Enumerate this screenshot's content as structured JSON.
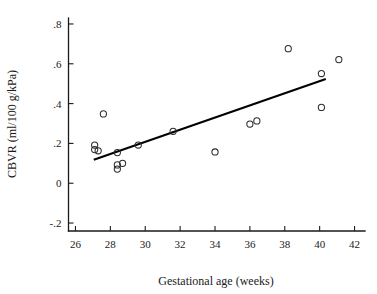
{
  "chart_data": {
    "type": "scatter",
    "title": "",
    "xlabel": "Gestational age (weeks)",
    "ylabel": "CBVR (ml/100 g/kPa)",
    "xlim": [
      25.6,
      42.6
    ],
    "ylim": [
      -0.24,
      0.83
    ],
    "xticks": [
      26,
      28,
      30,
      32,
      34,
      36,
      38,
      40,
      42
    ],
    "xticklabels": [
      "26",
      "28",
      "30",
      "32",
      "34",
      "36",
      "38",
      "40",
      "42"
    ],
    "yticks": [
      -0.2,
      0,
      0.2,
      0.4,
      0.6,
      0.8
    ],
    "yticklabels": [
      "-.2",
      "0",
      ".2",
      ".4",
      ".6",
      ".8"
    ],
    "grid": false,
    "legend": false,
    "marker": "open-circle",
    "marker_color": "#2b2b2b",
    "points": [
      {
        "x": 27.1,
        "y": 0.192
      },
      {
        "x": 27.1,
        "y": 0.169
      },
      {
        "x": 27.3,
        "y": 0.163
      },
      {
        "x": 27.6,
        "y": 0.348
      },
      {
        "x": 28.4,
        "y": 0.154
      },
      {
        "x": 28.4,
        "y": 0.092
      },
      {
        "x": 28.4,
        "y": 0.071
      },
      {
        "x": 28.7,
        "y": 0.1
      },
      {
        "x": 29.6,
        "y": 0.192
      },
      {
        "x": 31.6,
        "y": 0.261
      },
      {
        "x": 34.0,
        "y": 0.157
      },
      {
        "x": 36.0,
        "y": 0.297
      },
      {
        "x": 36.4,
        "y": 0.313
      },
      {
        "x": 38.2,
        "y": 0.676
      },
      {
        "x": 40.1,
        "y": 0.381
      },
      {
        "x": 40.1,
        "y": 0.551
      },
      {
        "x": 41.1,
        "y": 0.621
      }
    ],
    "fit_line": {
      "label": "regression line",
      "x_start": 27.05,
      "y_start": 0.118,
      "x_end": 40.35,
      "y_end": 0.523
    }
  },
  "figure": {
    "background_color": "#ffffff",
    "axis_color": "#1a1a1a",
    "line_color": "#000000"
  }
}
